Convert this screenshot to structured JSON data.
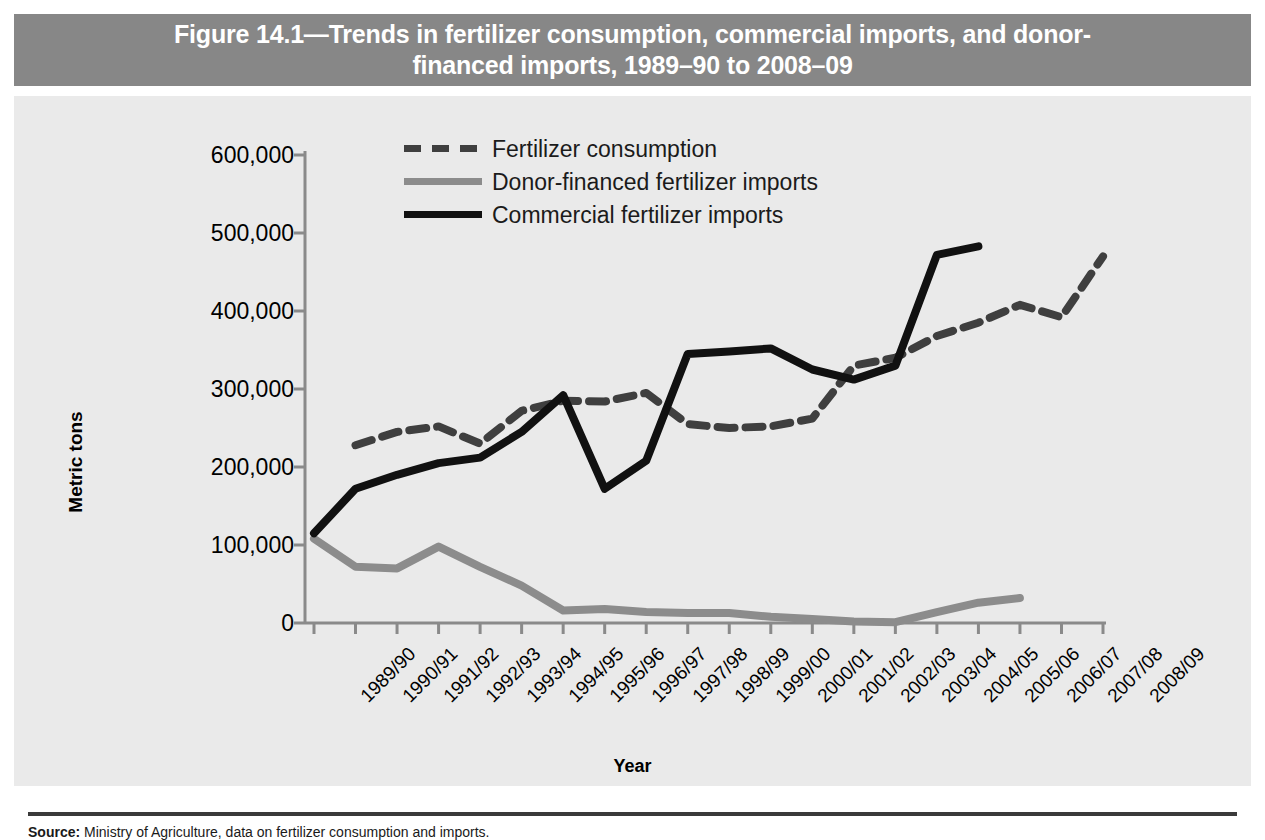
{
  "figure": {
    "title_line1": "Figure 14.1—Trends in fertilizer consumption, commercial imports, and donor-",
    "title_line2": "financed imports, 1989–90 to 2008–09",
    "title_bar_color": "#878787",
    "panel_color": "#eaeaea"
  },
  "source": {
    "label": "Source:",
    "text": " Ministry of Agriculture, data on fertilizer consumption and imports."
  },
  "chart_data": {
    "type": "line",
    "xlabel": "Year",
    "ylabel": "Metric tons",
    "ylim": [
      0,
      600000
    ],
    "yticks": [
      0,
      100000,
      200000,
      300000,
      400000,
      500000,
      600000
    ],
    "ytick_labels": [
      "0",
      "100,000",
      "200,000",
      "300,000",
      "400,000",
      "500,000",
      "600,000"
    ],
    "grid": false,
    "legend_position": "top-center",
    "categories": [
      "1989/90",
      "1990/91",
      "1991/92",
      "1992/93",
      "1993/94",
      "1994/95",
      "1995/96",
      "1996/97",
      "1997/98",
      "1998/99",
      "1999/00",
      "2000/01",
      "2001/02",
      "2002/03",
      "2003/04",
      "2004/05",
      "2005/06",
      "2006/07",
      "2007/08",
      "2008/09"
    ],
    "series": [
      {
        "name": "Fertilizer consumption",
        "style": "dashed",
        "color": "#3f3f3f",
        "values": [
          null,
          228000,
          245000,
          252000,
          230000,
          272000,
          285000,
          284000,
          295000,
          255000,
          250000,
          252000,
          262000,
          330000,
          340000,
          322000,
          375000,
          345000,
          330000,
          350000
        ],
        "values_note": "dashed series continues to 2008/09",
        "extra_values": [
          368000,
          385000,
          408000,
          392000,
          470000
        ]
      },
      {
        "name": "Donor-financed fertilizer imports",
        "style": "solid",
        "color": "#8c8c8c",
        "values": [
          108000,
          72000,
          70000,
          98000,
          72000,
          48000,
          16000,
          18000,
          14000,
          13000,
          13000,
          8000,
          5000,
          2000,
          1000,
          14000,
          26000,
          32000,
          null,
          null
        ]
      },
      {
        "name": "Commercial fertilizer imports",
        "style": "solid",
        "color": "#111111",
        "values": [
          115000,
          172000,
          190000,
          205000,
          212000,
          245000,
          292000,
          172000,
          208000,
          345000,
          348000,
          352000,
          325000,
          312000,
          330000,
          472000,
          483000,
          null,
          null,
          null
        ]
      }
    ]
  }
}
